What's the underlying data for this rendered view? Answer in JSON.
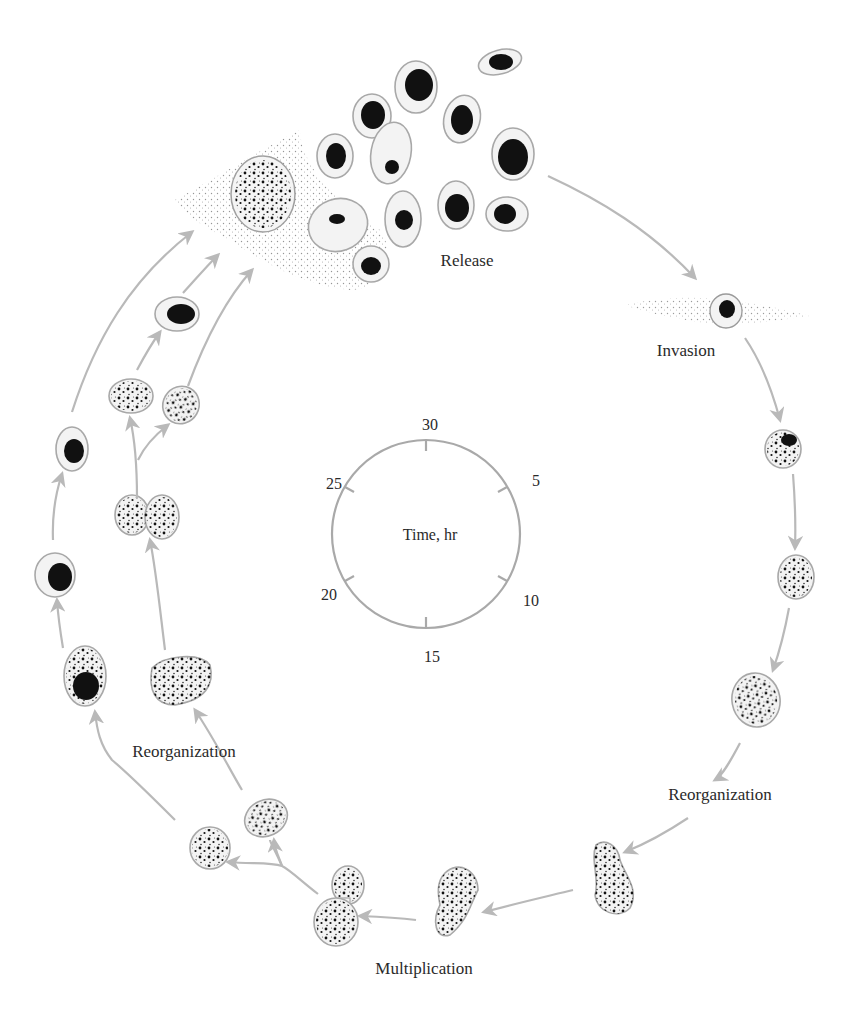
{
  "diagram": {
    "type": "life-cycle",
    "stages": [
      {
        "id": "release",
        "label": "Release"
      },
      {
        "id": "invasion",
        "label": "Invasion"
      },
      {
        "id": "reorganization_right",
        "label": "Reorganization"
      },
      {
        "id": "multiplication",
        "label": "Multiplication"
      },
      {
        "id": "reorganization_left",
        "label": "Reorganization"
      }
    ],
    "clock": {
      "center_label": "Time, hr",
      "ticks": [
        "30",
        "5",
        "10",
        "15",
        "20",
        "25"
      ]
    },
    "colors": {
      "arrow": "#b9b9b9",
      "cell_outline": "#a8a8a8",
      "nucleus": "#111111",
      "background": "#ffffff"
    }
  }
}
